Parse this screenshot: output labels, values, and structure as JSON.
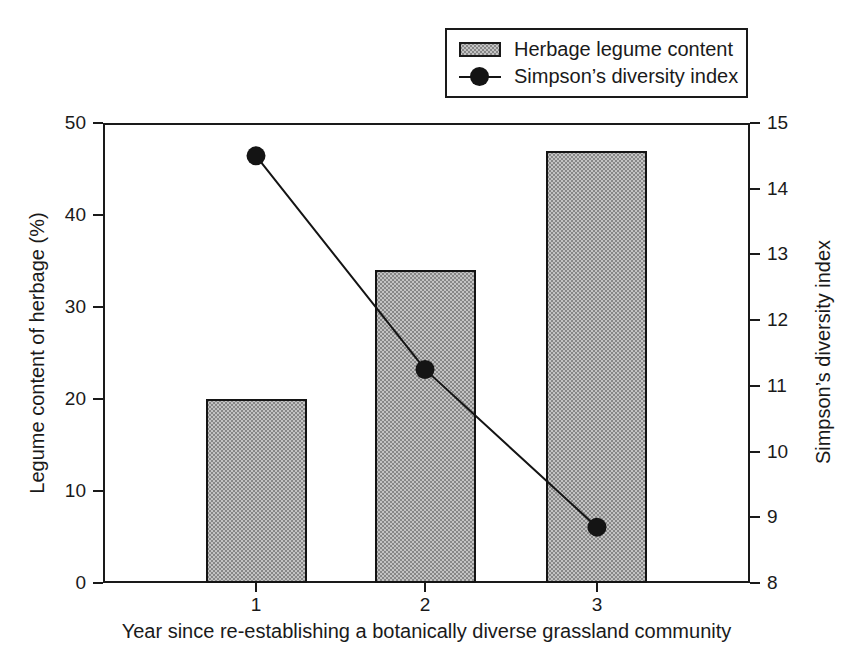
{
  "chart_data": {
    "type": "bar+line",
    "categories": [
      "1",
      "2",
      "3"
    ],
    "series": [
      {
        "name": "Herbage legume content",
        "type": "bar",
        "axis": "left",
        "values": [
          20,
          34,
          47
        ]
      },
      {
        "name": "Simpson’s diversity index",
        "type": "line",
        "axis": "right",
        "values": [
          14.5,
          11.25,
          8.85
        ]
      }
    ],
    "left_axis": {
      "label": "Legume content of herbage (%)",
      "min": 0,
      "max": 50,
      "step": 10,
      "ticks": [
        0,
        10,
        20,
        30,
        40,
        50
      ]
    },
    "right_axis": {
      "label": "Simpson’s diversity index",
      "min": 8,
      "max": 15,
      "step": 1,
      "ticks": [
        8,
        9,
        10,
        11,
        12,
        13,
        14,
        15
      ]
    },
    "x_axis": {
      "label": "Year since re-establishing a botanically diverse grassland community"
    },
    "grid": false,
    "legend_position": "top-right",
    "colors": {
      "bar_fill": "#c3c3c3",
      "bar_dot": "#878787",
      "bar_border": "#141414",
      "line": "#141414",
      "marker": "#141414",
      "frame": "#1a1a1a",
      "text": "#1a1a1a",
      "background": "#ffffff"
    }
  }
}
